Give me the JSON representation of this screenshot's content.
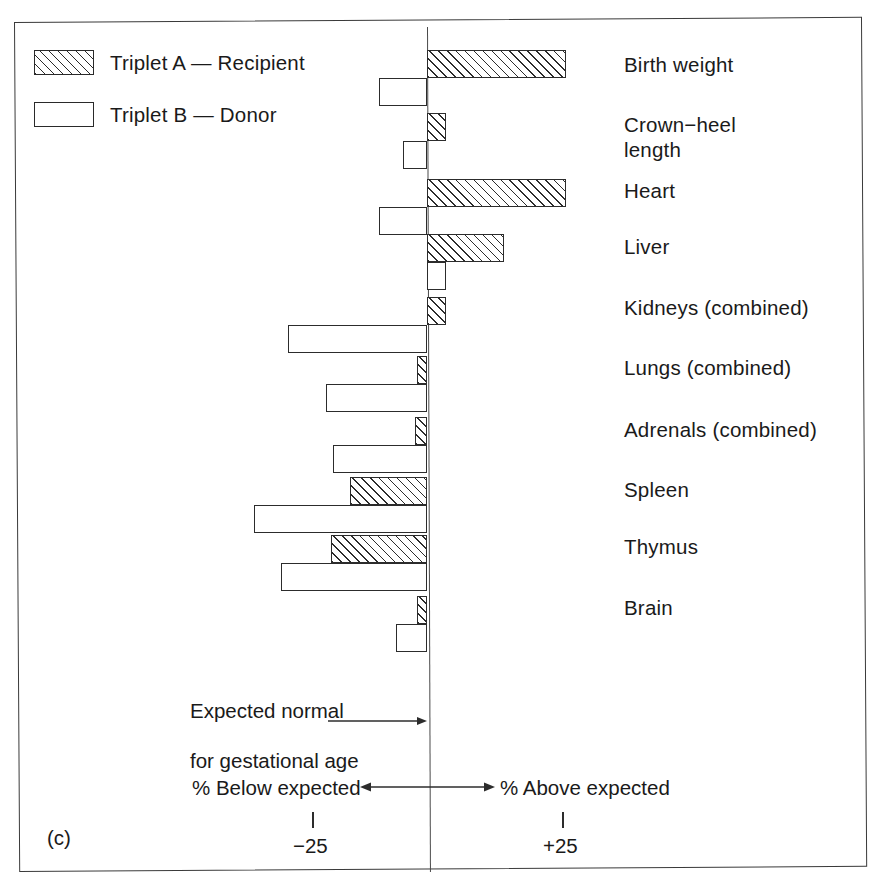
{
  "panel": {
    "letter": "(c)"
  },
  "legend": {
    "items": [
      {
        "key": "triplet-a",
        "label": "Triplet A — Recipient",
        "pattern": "diagonal-hatch"
      },
      {
        "key": "triplet-b",
        "label": "Triplet B — Donor",
        "pattern": "open"
      }
    ]
  },
  "annotations": {
    "expected_line_1": "Expected normal",
    "expected_line_2": "for gestational age",
    "below_expected": "% Below expected",
    "above_expected": "% Above expected",
    "tick_negative": "−25",
    "tick_positive": "+25"
  },
  "chart_data": {
    "type": "bar",
    "orientation": "horizontal",
    "title": "",
    "subtitle": "",
    "xlabel": "% deviation from expected normal for gestational age",
    "ylabel": "",
    "xlim": [
      -40,
      32
    ],
    "xticks": [
      -25,
      0,
      25
    ],
    "xticklabels": [
      "−25",
      "0",
      "+25"
    ],
    "grid": false,
    "legend_position": "top-left",
    "reference_line": {
      "value": 0,
      "label": "Expected normal for gestational age"
    },
    "categories": [
      "Birth weight",
      "Crown−heel\nlength",
      "Heart",
      "Liver",
      "Kidneys (combined)",
      "Lungs (combined)",
      "Adrenals (combined)",
      "Spleen",
      "Thymus",
      "Brain"
    ],
    "series": [
      {
        "name": "Triplet A — Recipient",
        "values": [
          29,
          4,
          29,
          16,
          4,
          -2,
          -2.5,
          -16,
          -20,
          -2
        ]
      },
      {
        "name": "Triplet B — Donor",
        "values": [
          -10,
          -5,
          -10,
          4,
          -29,
          -21,
          -19.5,
          -36,
          -30.5,
          -6.5
        ]
      }
    ]
  },
  "geometry": {
    "zero_x": 427,
    "px_per_percent": 4.8,
    "bar_height": 28,
    "pair_top": [
      50,
      113,
      179,
      234,
      297,
      356,
      417,
      477,
      535,
      596
    ],
    "label_top": [
      52,
      112,
      178,
      234,
      295,
      355,
      417,
      477,
      534,
      595
    ]
  }
}
